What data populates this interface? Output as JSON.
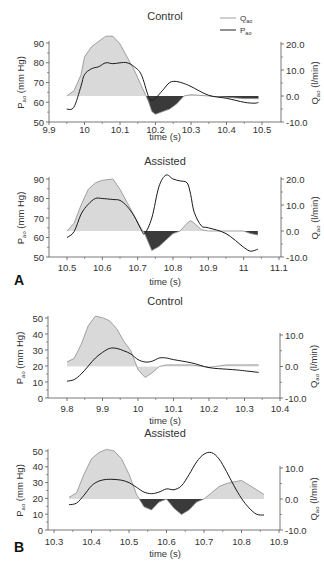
{
  "figure": {
    "panel_letters": [
      "A",
      "B"
    ],
    "legend": {
      "items": [
        {
          "label": "Q",
          "subscript": "ao",
          "style": "gray-line"
        },
        {
          "label": "P",
          "subscript": "ao",
          "style": "black-line"
        }
      ]
    },
    "colors": {
      "flow_fill_positive": "#d9d9d9",
      "flow_fill_negative": "#3a3a3a",
      "flow_line": "#8c8c8c",
      "pressure_line": "#1a1a1a",
      "axis": "#555555"
    }
  },
  "chart_data": [
    {
      "type": "line",
      "panel": "A",
      "title": "Control",
      "xlabel": "time (s)",
      "ylabel_left": "Pao (mm Hg)",
      "ylabel_right": "Qao (l/min)",
      "xticks": [
        "9.9",
        "10",
        "10.1",
        "10.2",
        "10.3",
        "10.4",
        "10.5"
      ],
      "yticks_left": [
        "50",
        "60",
        "70",
        "80",
        "90"
      ],
      "yticks_right": [
        "-10.0",
        "0.0",
        "10.0",
        "20.0"
      ],
      "xlim": [
        9.9,
        10.55
      ],
      "ylim_left": [
        50,
        90
      ],
      "ylim_right": [
        -10,
        20
      ],
      "series": [
        {
          "name": "Qao",
          "axis": "right",
          "fill": true,
          "x": [
            9.95,
            9.97,
            9.99,
            10.0,
            10.02,
            10.04,
            10.06,
            10.08,
            10.1,
            10.12,
            10.14,
            10.16,
            10.18,
            10.19,
            10.2,
            10.22,
            10.24,
            10.26,
            10.28,
            10.3,
            10.35,
            10.4,
            10.45,
            10.48,
            10.49
          ],
          "values": [
            0,
            2,
            8,
            15,
            19,
            21,
            23,
            23,
            20,
            15,
            10,
            4,
            -2,
            -6,
            -7,
            -6,
            -5,
            -3,
            0,
            0.5,
            0,
            -0.5,
            -1,
            -1,
            -1
          ]
        },
        {
          "name": "Pao",
          "axis": "left",
          "x": [
            9.95,
            9.97,
            9.99,
            10.0,
            10.02,
            10.04,
            10.06,
            10.08,
            10.1,
            10.12,
            10.14,
            10.16,
            10.18,
            10.19,
            10.2,
            10.22,
            10.24,
            10.26,
            10.28,
            10.3,
            10.35,
            10.4,
            10.45,
            10.48,
            10.49
          ],
          "values": [
            56.5,
            57.5,
            68,
            74,
            77,
            78,
            80,
            79.5,
            80,
            80,
            78,
            74,
            63,
            61,
            62,
            66,
            70,
            70.5,
            69.5,
            68,
            63.5,
            62,
            60,
            59.5,
            60
          ]
        }
      ]
    },
    {
      "type": "line",
      "panel": "A",
      "title": "Assisted",
      "xlabel": "time (s)",
      "ylabel_left": "Pao (mm Hg)",
      "ylabel_right": "Qao (l/min)",
      "xticks": [
        "10.5",
        "10.6",
        "10.7",
        "10.8",
        "10.9",
        "11",
        "11.1"
      ],
      "yticks_left": [
        "50",
        "60",
        "70",
        "80",
        "90"
      ],
      "yticks_right": [
        "-10.0",
        "0.0",
        "10.0",
        "20.0"
      ],
      "xlim": [
        10.45,
        11.1
      ],
      "ylim_left": [
        50,
        90
      ],
      "ylim_right": [
        -10,
        20
      ],
      "series": [
        {
          "name": "Qao",
          "axis": "right",
          "fill": true,
          "x": [
            10.5,
            10.52,
            10.54,
            10.56,
            10.58,
            10.6,
            10.63,
            10.65,
            10.67,
            10.69,
            10.71,
            10.72,
            10.74,
            10.76,
            10.78,
            10.8,
            10.82,
            10.84,
            10.85,
            10.86,
            10.88,
            10.9,
            10.95,
            11.0,
            11.02,
            11.04
          ],
          "values": [
            0,
            3,
            10,
            16,
            18.5,
            19.5,
            20,
            16,
            11,
            6,
            1,
            -1,
            -7.5,
            -6,
            -3.5,
            -1,
            0,
            3,
            4,
            3,
            0.5,
            0,
            0,
            0,
            -1,
            -1.5
          ]
        },
        {
          "name": "Pao",
          "axis": "left",
          "x": [
            10.5,
            10.52,
            10.54,
            10.56,
            10.58,
            10.6,
            10.63,
            10.65,
            10.67,
            10.69,
            10.71,
            10.72,
            10.74,
            10.76,
            10.78,
            10.8,
            10.82,
            10.84,
            10.85,
            10.86,
            10.88,
            10.9,
            10.95,
            11.0,
            11.02,
            11.04
          ],
          "values": [
            60,
            63,
            72,
            77,
            80,
            80,
            79.5,
            79,
            76,
            71,
            64,
            62,
            70,
            86,
            92,
            90,
            89,
            88,
            82,
            73,
            66,
            65,
            62,
            55,
            53,
            54
          ]
        }
      ]
    },
    {
      "type": "line",
      "panel": "B",
      "title": "Control",
      "xlabel": "time (s)",
      "ylabel_left": "Pao (mm Hg)",
      "ylabel_right": "Qao (l/min)",
      "xticks": [
        "9.8",
        "9.9",
        "10",
        "10.1",
        "10.2",
        "10.3",
        "10.4"
      ],
      "yticks_left": [
        "0",
        "10",
        "20",
        "30",
        "40",
        "50"
      ],
      "yticks_right": [
        "-10.0",
        "0.0",
        "10.0"
      ],
      "xlim": [
        9.75,
        10.4
      ],
      "ylim_left": [
        0,
        50
      ],
      "ylim_right": [
        -10,
        15
      ],
      "series": [
        {
          "name": "Qao",
          "axis": "right",
          "fill": true,
          "x": [
            9.8,
            9.82,
            9.84,
            9.86,
            9.88,
            9.9,
            9.92,
            9.94,
            9.96,
            9.98,
            10.0,
            10.02,
            10.04,
            10.06,
            10.08,
            10.1,
            10.15,
            10.2,
            10.25,
            10.28,
            10.3,
            10.34
          ],
          "values": [
            1.5,
            2.5,
            7,
            13,
            16,
            15.5,
            14.5,
            12,
            8,
            5,
            -1,
            -3.5,
            -2,
            0,
            0.5,
            0.5,
            0.5,
            -0.3,
            0.5,
            0.5,
            0.5,
            0.5
          ]
        },
        {
          "name": "Pao",
          "axis": "left",
          "x": [
            9.8,
            9.82,
            9.84,
            9.86,
            9.88,
            9.9,
            9.92,
            9.94,
            9.96,
            9.98,
            10.0,
            10.02,
            10.04,
            10.06,
            10.08,
            10.1,
            10.15,
            10.2,
            10.25,
            10.28,
            10.3,
            10.34
          ],
          "values": [
            10.5,
            11.5,
            15,
            20,
            25,
            28.5,
            31,
            31,
            29.5,
            27.5,
            24,
            22.5,
            23,
            25,
            25,
            24,
            22,
            19,
            18,
            17.5,
            17,
            16
          ]
        }
      ]
    },
    {
      "type": "line",
      "panel": "B",
      "title": "Assisted",
      "xlabel": "time (s)",
      "ylabel_left": "Pao (mm Hg)",
      "ylabel_right": "Qao (l/min)",
      "xticks": [
        "10.3",
        "10.4",
        "10.5",
        "10.6",
        "10.7",
        "10.8",
        "10.9"
      ],
      "yticks_left": [
        "0",
        "10",
        "20",
        "30",
        "40",
        "50"
      ],
      "yticks_right": [
        "-10.0",
        "0.0",
        "10.0"
      ],
      "xlim": [
        10.3,
        10.9
      ],
      "ylim_left": [
        0,
        50
      ],
      "ylim_right": [
        -10,
        15
      ],
      "series": [
        {
          "name": "Qao",
          "axis": "right",
          "fill": true,
          "x": [
            10.34,
            10.36,
            10.38,
            10.4,
            10.42,
            10.44,
            10.46,
            10.48,
            10.5,
            10.52,
            10.54,
            10.56,
            10.58,
            10.6,
            10.62,
            10.64,
            10.66,
            10.68,
            10.7,
            10.72,
            10.74,
            10.76,
            10.78,
            10.8,
            10.82,
            10.84,
            10.86
          ],
          "values": [
            0.5,
            2,
            8,
            13,
            15,
            16,
            15.5,
            13,
            8,
            1.5,
            -2.5,
            -3.5,
            -1,
            0,
            -3,
            -5,
            -3.5,
            -1,
            0,
            2,
            4,
            5,
            5.5,
            6,
            4.5,
            3,
            1.5
          ]
        },
        {
          "name": "Pao",
          "axis": "left",
          "x": [
            10.34,
            10.36,
            10.38,
            10.4,
            10.42,
            10.44,
            10.46,
            10.48,
            10.5,
            10.52,
            10.54,
            10.56,
            10.58,
            10.6,
            10.62,
            10.64,
            10.66,
            10.68,
            10.7,
            10.72,
            10.74,
            10.76,
            10.78,
            10.8,
            10.82,
            10.84,
            10.86
          ],
          "values": [
            16,
            17,
            22,
            28,
            31,
            32,
            32,
            31.5,
            30,
            27,
            24,
            23,
            24,
            26,
            25.5,
            28,
            35,
            43,
            48,
            49,
            45,
            37,
            28,
            20,
            14,
            10,
            9.5
          ]
        }
      ]
    }
  ]
}
